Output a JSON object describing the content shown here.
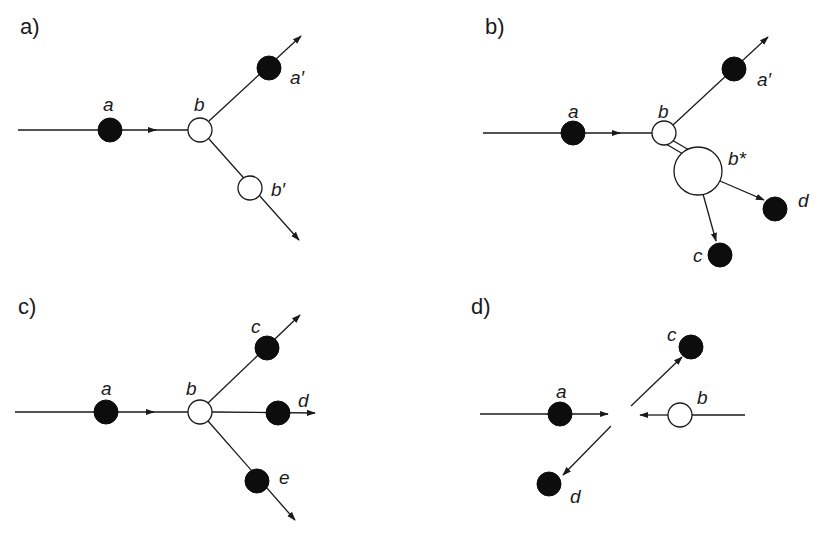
{
  "panels": {
    "a": {
      "title": "a)",
      "labels": {
        "a": "a",
        "b": "b",
        "a_prime": "a′",
        "b_prime": "b′"
      }
    },
    "b": {
      "title": "b)",
      "labels": {
        "a": "a",
        "b": "b",
        "a_prime": "a′",
        "b_star": "b*",
        "c": "c",
        "d": "d"
      }
    },
    "c": {
      "title": "c)",
      "labels": {
        "a": "a",
        "b": "b",
        "c": "c",
        "d": "d",
        "e": "e"
      }
    },
    "d": {
      "title": "d)",
      "labels": {
        "a": "a",
        "b": "b",
        "c": "c",
        "d": "d"
      }
    }
  },
  "legend": {
    "filled_circle": "black particle",
    "hollow_circle": "white particle"
  },
  "colors": {
    "ink": "#1a1a1a",
    "fill": "#0d0d0d",
    "background": "#ffffff"
  }
}
